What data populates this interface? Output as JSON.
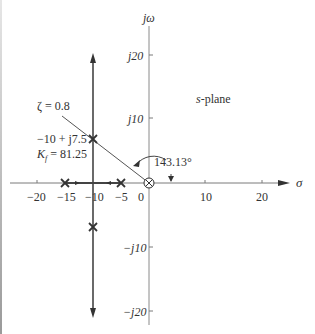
{
  "figure": {
    "plane_label": "s-plane",
    "plane_label_var": "s",
    "plane_label_rest": "-plane",
    "axes": {
      "x_label": "σ",
      "y_label": "jω",
      "x_ticks": [
        {
          "value": -20,
          "label": "−20"
        },
        {
          "value": -15,
          "label": "−15"
        },
        {
          "value": -10,
          "label": "−10"
        },
        {
          "value": -5,
          "label": "−5"
        },
        {
          "value": 0,
          "label": "0"
        },
        {
          "value": 10,
          "label": "10"
        },
        {
          "value": 20,
          "label": "20"
        }
      ],
      "y_ticks": [
        {
          "value": 20,
          "label": "j20"
        },
        {
          "value": 10,
          "label": "j10"
        },
        {
          "value": -10,
          "label": "−j10"
        },
        {
          "value": -20,
          "label": "−j20"
        }
      ]
    },
    "annotations": {
      "damping_line": "ζ = 0.8",
      "point_coord": "−10 + j7.5",
      "gain_prefix": "K",
      "gain_sub": "f",
      "gain_value": " = 81.25",
      "angle": "143.13°"
    },
    "poles": [
      {
        "re": -15,
        "im": 0
      },
      {
        "re": -5,
        "im": 0
      },
      {
        "re": -10,
        "im": 7.5
      },
      {
        "re": -10,
        "im": -7.5
      }
    ],
    "zeros_or_origin_marker": [
      {
        "re": 0,
        "im": 0,
        "symbol": "⊗"
      }
    ],
    "colors": {
      "axis": "#7a7a7a",
      "locus": "#444444",
      "text": "#333333"
    }
  }
}
